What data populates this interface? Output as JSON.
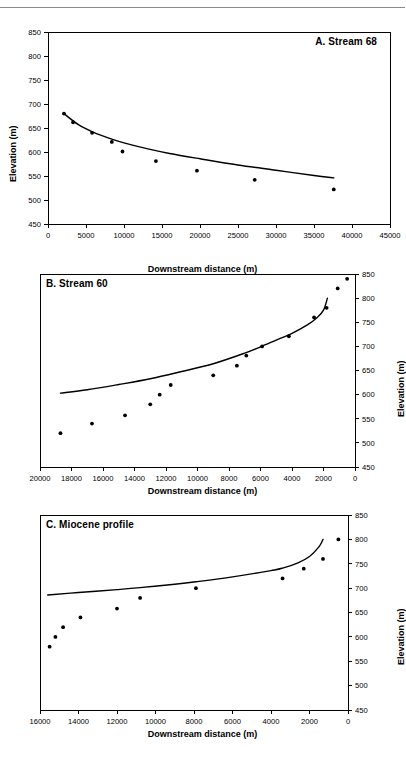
{
  "figure": {
    "xlabel": "Downstream distance (m)",
    "ylabel": "Elevation (m)",
    "point_color": "#000000",
    "line_color": "#000000",
    "axis_color": "#000000",
    "background": "#ffffff"
  },
  "chart_data": [
    {
      "type": "scatter",
      "title": "A. Stream 68",
      "title_position": "top-right",
      "xlabel": "Downstream distance (m)",
      "ylabel": "Elevation (m)",
      "xlim": [
        0,
        45000
      ],
      "ylim": [
        450,
        850
      ],
      "xticks": [
        0,
        5000,
        10000,
        15000,
        20000,
        25000,
        30000,
        35000,
        40000,
        45000
      ],
      "yticks": [
        450,
        500,
        550,
        600,
        650,
        700,
        750,
        800,
        850
      ],
      "x_reversed": false,
      "y_axis_side": "left",
      "grid": false,
      "legend": "none",
      "series": [
        {
          "name": "Measured profile points",
          "marker": "filled-circle",
          "x": [
            2100,
            3300,
            5800,
            8400,
            9800,
            14200,
            19600,
            27200,
            37600
          ],
          "y": [
            680,
            662,
            640,
            621,
            601,
            581,
            561,
            542,
            522
          ]
        },
        {
          "name": "Fitted profile curve",
          "marker": "none",
          "line": "solid",
          "x": [
            2100,
            4000,
            6000,
            8000,
            10000,
            13000,
            16000,
            20000,
            25000,
            30000,
            35000,
            37600
          ],
          "y": [
            680,
            657,
            641,
            629,
            619,
            607,
            597,
            586,
            573,
            562,
            551,
            546
          ]
        }
      ]
    },
    {
      "type": "scatter",
      "title": "B. Stream 60",
      "title_position": "top-left",
      "xlabel": "Downstream distance (m)",
      "ylabel": "Elevation (m)",
      "xlim": [
        0,
        20000
      ],
      "ylim": [
        450,
        850
      ],
      "xticks": [
        20000,
        18000,
        16000,
        14000,
        12000,
        10000,
        8000,
        6000,
        4000,
        2000,
        0
      ],
      "yticks": [
        450,
        500,
        550,
        600,
        650,
        700,
        750,
        800,
        850
      ],
      "x_reversed": true,
      "y_axis_side": "right",
      "grid": false,
      "legend": "none",
      "series": [
        {
          "name": "Measured profile points",
          "marker": "filled-circle",
          "x": [
            18700,
            16700,
            14600,
            13000,
            12400,
            11700,
            9000,
            7500,
            6900,
            5900,
            4200,
            2600,
            1800,
            1100,
            500
          ],
          "y": [
            520,
            540,
            557,
            580,
            600,
            620,
            640,
            660,
            681,
            700,
            721,
            760,
            780,
            820,
            840
          ]
        },
        {
          "name": "Fitted profile curve",
          "marker": "none",
          "line": "solid",
          "x": [
            18700,
            17000,
            15000,
            13000,
            11000,
            9000,
            7000,
            6000,
            5000,
            4000,
            3000,
            2400,
            2000,
            1750
          ],
          "y": [
            603,
            610,
            621,
            633,
            648,
            664,
            686,
            699,
            713,
            727,
            745,
            760,
            775,
            800
          ]
        }
      ]
    },
    {
      "type": "scatter",
      "title": "C. Miocene profile",
      "title_position": "top-left",
      "xlabel": "Downstream distance (m)",
      "ylabel": "Elevation (m)",
      "xlim": [
        0,
        16000
      ],
      "ylim": [
        450,
        850
      ],
      "xticks": [
        16000,
        14000,
        12000,
        10000,
        8000,
        6000,
        4000,
        2000,
        0
      ],
      "yticks": [
        450,
        500,
        550,
        600,
        650,
        700,
        750,
        800,
        850
      ],
      "x_reversed": true,
      "y_axis_side": "right",
      "grid": false,
      "legend": "none",
      "series": [
        {
          "name": "Measured profile points",
          "marker": "filled-circle",
          "x": [
            15500,
            15200,
            14800,
            13900,
            12000,
            10800,
            7900,
            3400,
            2300,
            1300,
            500
          ],
          "y": [
            580,
            600,
            620,
            640,
            658,
            680,
            700,
            720,
            740,
            760,
            800
          ]
        },
        {
          "name": "Fitted profile curve",
          "marker": "none",
          "line": "solid",
          "x": [
            15600,
            14000,
            12000,
            10800,
            9000,
            7900,
            6000,
            4000,
            3400,
            2600,
            2000,
            1500,
            1300
          ],
          "y": [
            686,
            691,
            697,
            701,
            708,
            713,
            723,
            736,
            741,
            752,
            765,
            785,
            800
          ]
        }
      ]
    }
  ]
}
